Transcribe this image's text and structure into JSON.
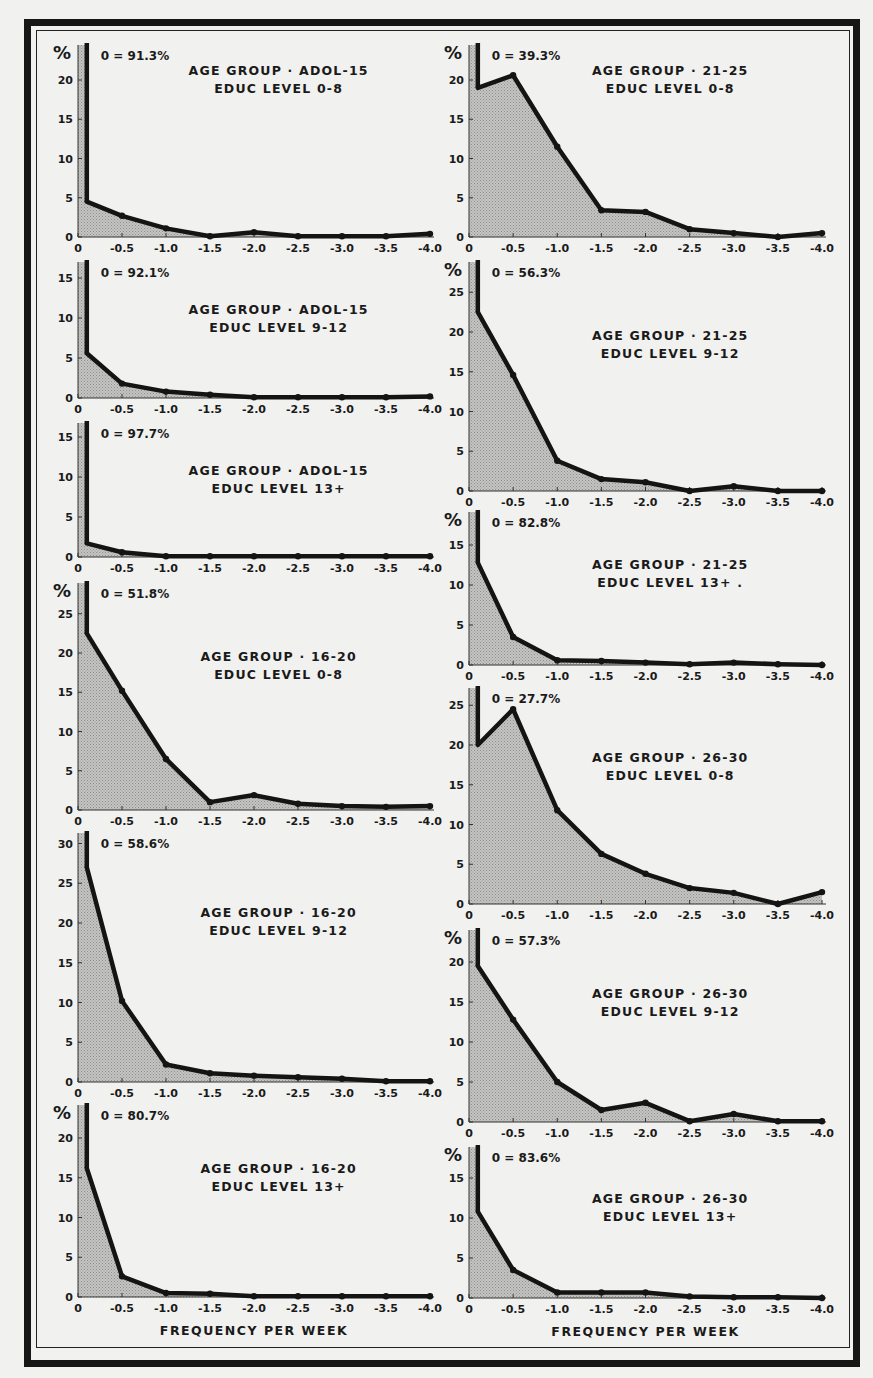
{
  "figure": {
    "x_axis_title": "FREQUENCY PER WEEK",
    "y_unit_symbol": "%",
    "x_tick_labels": [
      "0",
      "-0.5",
      "-1.0",
      "-1.5",
      "-2.0",
      "-2.5",
      "-3.0",
      "-3.5",
      "-4.0"
    ],
    "colors": {
      "line": "#141414",
      "fill": "#b8b8b8",
      "background": "#f1f1ef",
      "frame": "#161616"
    }
  },
  "chart_data": [
    {
      "type": "area",
      "id": "adol15_0_8",
      "title": "AGE GROUP · ADOL-15",
      "subtitle": "EDUC LEVEL 0-8",
      "zero_label": "0 = 91.3%",
      "zero_value": 91.3,
      "xlabel": "",
      "ylabel": "%",
      "x": [
        0.1,
        0.5,
        1.0,
        1.5,
        2.0,
        2.5,
        3.0,
        3.5,
        4.0
      ],
      "values": [
        4.5,
        2.7,
        1.1,
        0.1,
        0.6,
        0.1,
        0.1,
        0.1,
        0.4
      ],
      "yticks": [
        0,
        5,
        10,
        15,
        20
      ],
      "ylim": [
        0,
        23
      ],
      "column": "left",
      "show_pct": true
    },
    {
      "type": "area",
      "id": "adol15_9_12",
      "title": "AGE GROUP · ADOL-15",
      "subtitle": "EDUC LEVEL 9-12",
      "zero_label": "0 = 92.1%",
      "zero_value": 92.1,
      "xlabel": "",
      "ylabel": "%",
      "x": [
        0.1,
        0.5,
        1.0,
        1.5,
        2.0,
        2.5,
        3.0,
        3.5,
        4.0
      ],
      "values": [
        5.6,
        1.8,
        0.8,
        0.4,
        0.1,
        0.1,
        0.1,
        0.1,
        0.2
      ],
      "yticks": [
        0,
        5,
        10,
        15
      ],
      "ylim": [
        0,
        17
      ],
      "column": "left",
      "show_pct": false
    },
    {
      "type": "area",
      "id": "adol15_13p",
      "title": "AGE GROUP · ADOL-15",
      "subtitle": "EDUC LEVEL 13+",
      "zero_label": "0 = 97.7%",
      "zero_value": 97.7,
      "xlabel": "",
      "ylabel": "%",
      "x": [
        0.1,
        0.5,
        1.0,
        1.5,
        2.0,
        2.5,
        3.0,
        3.5,
        4.0
      ],
      "values": [
        1.7,
        0.6,
        0.1,
        0.1,
        0.1,
        0.1,
        0.1,
        0.1,
        0.1
      ],
      "yticks": [
        0,
        5,
        10,
        15
      ],
      "ylim": [
        0,
        17
      ],
      "column": "left",
      "show_pct": false
    },
    {
      "type": "area",
      "id": "a16_20_0_8",
      "title": "AGE GROUP · 16-20",
      "subtitle": "EDUC LEVEL 0-8",
      "zero_label": "0 = 51.8%",
      "zero_value": 51.8,
      "xlabel": "",
      "ylabel": "%",
      "x": [
        0.1,
        0.5,
        1.0,
        1.5,
        2.0,
        2.5,
        3.0,
        3.5,
        4.0
      ],
      "values": [
        22.5,
        15.2,
        6.5,
        1.0,
        1.9,
        0.8,
        0.5,
        0.4,
        0.5
      ],
      "yticks": [
        0,
        5,
        10,
        15,
        20,
        25
      ],
      "ylim": [
        0,
        29
      ],
      "column": "left",
      "show_pct": true
    },
    {
      "type": "area",
      "id": "a16_20_9_12",
      "title": "AGE GROUP · 16-20",
      "subtitle": "EDUC LEVEL 9-12",
      "zero_label": "0 = 58.6%",
      "zero_value": 58.6,
      "xlabel": "",
      "ylabel": "%",
      "x": [
        0.1,
        0.5,
        1.0,
        1.5,
        2.0,
        2.5,
        3.0,
        3.5,
        4.0
      ],
      "values": [
        27.0,
        10.2,
        2.2,
        1.1,
        0.8,
        0.6,
        0.4,
        0.1,
        0.1
      ],
      "yticks": [
        0,
        5,
        10,
        15,
        20,
        25,
        30
      ],
      "ylim": [
        0,
        31
      ],
      "column": "left",
      "show_pct": false
    },
    {
      "type": "area",
      "id": "a16_20_13p",
      "title": "AGE GROUP · 16-20",
      "subtitle": "EDUC LEVEL 13+",
      "zero_label": "0 = 80.7%",
      "zero_value": 80.7,
      "xlabel": "FREQUENCY PER WEEK",
      "ylabel": "%",
      "x": [
        0.1,
        0.5,
        1.0,
        1.5,
        2.0,
        2.5,
        3.0,
        3.5,
        4.0
      ],
      "values": [
        16.2,
        2.6,
        0.5,
        0.4,
        0.1,
        0.1,
        0.1,
        0.1,
        0.1
      ],
      "yticks": [
        0,
        5,
        10,
        15,
        20
      ],
      "ylim": [
        0,
        24
      ],
      "column": "left",
      "show_pct": true
    },
    {
      "type": "area",
      "id": "a21_25_0_8",
      "title": "AGE GROUP · 21-25",
      "subtitle": "EDUC LEVEL 0-8",
      "zero_label": "0 = 39.3%",
      "zero_value": 39.3,
      "xlabel": "",
      "ylabel": "%",
      "x": [
        0.1,
        0.5,
        1.0,
        1.5,
        2.0,
        2.5,
        3.0,
        3.5,
        4.0
      ],
      "values": [
        19.0,
        20.6,
        11.5,
        3.4,
        3.2,
        1.0,
        0.5,
        0.0,
        0.5
      ],
      "yticks": [
        0,
        5,
        10,
        15,
        20
      ],
      "ylim": [
        0,
        23
      ],
      "column": "right",
      "show_pct": true
    },
    {
      "type": "area",
      "id": "a21_25_9_12",
      "title": "AGE GROUP · 21-25",
      "subtitle": "EDUC LEVEL 9-12",
      "zero_label": "0 = 56.3%",
      "zero_value": 56.3,
      "xlabel": "",
      "ylabel": "%",
      "x": [
        0.1,
        0.5,
        1.0,
        1.5,
        2.0,
        2.5,
        3.0,
        3.5,
        4.0
      ],
      "values": [
        22.5,
        14.6,
        3.8,
        1.5,
        1.1,
        0.0,
        0.6,
        0.0,
        0.0
      ],
      "yticks": [
        0,
        5,
        10,
        15,
        20,
        25
      ],
      "ylim": [
        0,
        29
      ],
      "column": "right",
      "show_pct": true
    },
    {
      "type": "area",
      "id": "a21_25_13p",
      "title": "AGE GROUP · 21-25",
      "subtitle": "EDUC LEVEL 13+ .",
      "zero_label": "0 = 82.8%",
      "zero_value": 82.8,
      "xlabel": "",
      "ylabel": "%",
      "x": [
        0.1,
        0.5,
        1.0,
        1.5,
        2.0,
        2.5,
        3.0,
        3.5,
        4.0
      ],
      "values": [
        12.8,
        3.5,
        0.6,
        0.5,
        0.3,
        0.1,
        0.3,
        0.1,
        0.0
      ],
      "yticks": [
        0,
        5,
        10,
        15
      ],
      "ylim": [
        0,
        19
      ],
      "column": "right",
      "show_pct": true
    },
    {
      "type": "area",
      "id": "a26_30_0_8",
      "title": "AGE GROUP · 26-30",
      "subtitle": "EDUC LEVEL 0-8",
      "zero_label": "0 = 27.7%",
      "zero_value": 27.7,
      "xlabel": "",
      "ylabel": "%",
      "x": [
        0.1,
        0.5,
        1.0,
        1.5,
        2.0,
        2.5,
        3.0,
        3.5,
        4.0
      ],
      "values": [
        20.0,
        24.5,
        11.8,
        6.3,
        3.8,
        2.0,
        1.4,
        0.0,
        1.5
      ],
      "yticks": [
        0,
        5,
        10,
        15,
        20,
        25
      ],
      "ylim": [
        0,
        27
      ],
      "column": "right",
      "show_pct": false
    },
    {
      "type": "area",
      "id": "a26_30_9_12",
      "title": "AGE GROUP · 26-30",
      "subtitle": "EDUC LEVEL 9-12",
      "zero_label": "0 = 57.3%",
      "zero_value": 57.3,
      "xlabel": "",
      "ylabel": "%",
      "x": [
        0.1,
        0.5,
        1.0,
        1.5,
        2.0,
        2.5,
        3.0,
        3.5,
        4.0
      ],
      "values": [
        19.5,
        12.8,
        5.0,
        1.5,
        2.4,
        0.1,
        1.0,
        0.1,
        0.1
      ],
      "yticks": [
        0,
        5,
        10,
        15,
        20
      ],
      "ylim": [
        0,
        24
      ],
      "column": "right",
      "show_pct": true
    },
    {
      "type": "area",
      "id": "a26_30_13p",
      "title": "AGE GROUP · 26-30",
      "subtitle": "EDUC LEVEL 13+",
      "zero_label": "0 = 83.6%",
      "zero_value": 83.6,
      "xlabel": "FREQUENCY PER WEEK",
      "ylabel": "%",
      "x": [
        0.1,
        0.5,
        1.0,
        1.5,
        2.0,
        2.5,
        3.0,
        3.5,
        4.0
      ],
      "values": [
        10.8,
        3.5,
        0.7,
        0.7,
        0.7,
        0.2,
        0.1,
        0.1,
        0.0
      ],
      "yticks": [
        0,
        5,
        10,
        15
      ],
      "ylim": [
        0,
        19
      ],
      "column": "right",
      "show_pct": true
    }
  ]
}
